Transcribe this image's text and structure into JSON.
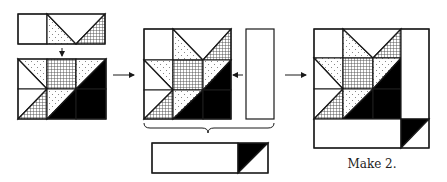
{
  "diagram": {
    "caption": "Make 2.",
    "colors": {
      "line": "#1a1a1a",
      "background": "#ffffff",
      "dark_fabric": "#000000",
      "speckle_fabric_dots": "#555555",
      "grid_fabric_lines": "#444444"
    },
    "fabrics": [
      "white",
      "speckled",
      "crosshatch",
      "black"
    ],
    "steps": [
      {
        "id": "step-1",
        "label": "Top row units joined to bottom two rows"
      },
      {
        "id": "step-2",
        "label": "Star block plus side strip"
      },
      {
        "id": "step-3",
        "label": "Bottom strip with half-square triangle"
      },
      {
        "id": "step-4",
        "label": "Completed block"
      }
    ]
  }
}
